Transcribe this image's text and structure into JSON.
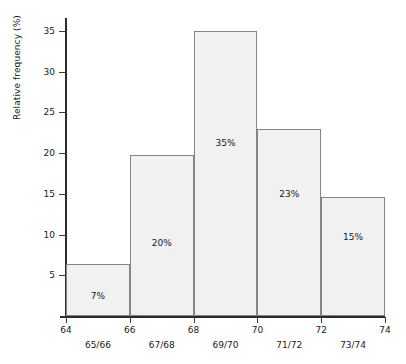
{
  "chart_data": {
    "type": "bar",
    "title": "",
    "subtitle": "",
    "xlabel": "",
    "ylabel": "Relative frequency (%)",
    "categories": [
      "65/66",
      "67/68",
      "69/70",
      "71/72",
      "73/74"
    ],
    "values": [
      6.4,
      19.8,
      35.0,
      23.0,
      14.6
    ],
    "data_labels": [
      "7%",
      "20%",
      "23%",
      "15%",
      "35%"
    ],
    "bar_labels": [
      "7%",
      "20%",
      "35%",
      "23%",
      "15%"
    ],
    "bin_edges": [
      64,
      66,
      68,
      70,
      72,
      74
    ],
    "xlim": [
      64,
      74
    ],
    "ylim": [
      0,
      36
    ],
    "xticks": [
      "64",
      "66",
      "68",
      "70",
      "72",
      "74"
    ],
    "yticks": [
      "5",
      "10",
      "15",
      "20",
      "25",
      "30",
      "35"
    ],
    "grid": false,
    "legend": null,
    "colors": {
      "bar_fill": "#f1f1f1",
      "bar_edge": "#858585",
      "axis": "#2b2b2b",
      "text": "#1a1a1a",
      "background": "#ffffff"
    }
  },
  "axes": {
    "y_title": "Relative frequency (%)"
  }
}
